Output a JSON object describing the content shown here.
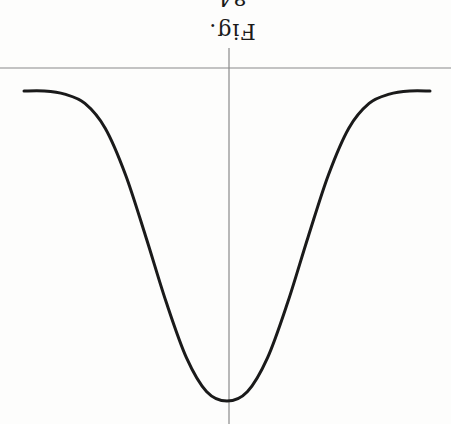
{
  "figure": {
    "caption": "Fig. 84",
    "orientation": "rotated 180 degrees"
  },
  "colors": {
    "background": "#fdfdfc",
    "curve": "#1a1a1a",
    "axes": "#8a8a8a"
  },
  "chart_data": {
    "type": "line",
    "title": "Fig. 84",
    "xlabel": "",
    "ylabel": "",
    "grid": false,
    "legend": null,
    "x": [
      -1.0,
      -0.9,
      -0.8,
      -0.7,
      -0.6,
      -0.5,
      -0.4,
      -0.3,
      -0.2,
      -0.1,
      0.0,
      0.1,
      0.2,
      0.3,
      0.4,
      0.5,
      0.6,
      0.7,
      0.8,
      0.9,
      1.0
    ],
    "series": [
      {
        "name": "curve",
        "values": [
          0.0,
          0.0,
          0.01,
          0.04,
          0.12,
          0.27,
          0.47,
          0.68,
          0.86,
          0.97,
          1.0,
          0.97,
          0.86,
          0.68,
          0.47,
          0.27,
          0.12,
          0.04,
          0.01,
          0.0,
          0.0
        ]
      }
    ],
    "xlim": [
      -1.1,
      1.1
    ],
    "ylim": [
      0,
      1.07
    ]
  }
}
